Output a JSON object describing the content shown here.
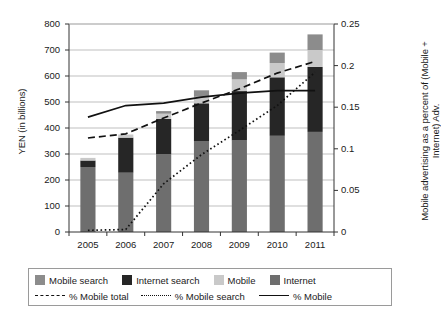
{
  "chart_data": {
    "type": "bar",
    "subtype": "stacked-bar-with-lines",
    "title": "",
    "xlabel": "",
    "ylabel": "YEN (in billions)",
    "ylabel_right": "Mobile advertising as a percent of (Mobile + Internet) Adv.",
    "categories": [
      "2005",
      "2006",
      "2007",
      "2008",
      "2009",
      "2010",
      "2011"
    ],
    "ylim": [
      0,
      800
    ],
    "yticks": [
      0,
      100,
      200,
      300,
      400,
      500,
      600,
      700,
      800
    ],
    "ytick_labels": [
      "0",
      "100",
      "200",
      "300",
      "400",
      "500",
      "600",
      "700",
      "800"
    ],
    "ylim_right": [
      0,
      0.25
    ],
    "yticks_right": [
      0,
      0.05,
      0.1,
      0.15,
      0.2,
      0.25
    ],
    "ytick_labels_right": [
      "0",
      "0.05",
      "0.1",
      "0.15",
      "0.2",
      "0.25"
    ],
    "grid": true,
    "grid_axis": "y",
    "legend_position": "bottom",
    "series": [
      {
        "name": "Internet",
        "kind": "bar-segment",
        "color": "#6e6e6e",
        "values": [
          250,
          228,
          300,
          350,
          352,
          370,
          385
        ]
      },
      {
        "name": "Internet search",
        "kind": "bar-segment",
        "color": "#262626",
        "values": [
          25,
          135,
          135,
          145,
          190,
          225,
          250
        ]
      },
      {
        "name": "Mobile",
        "kind": "bar-segment",
        "color": "#c9c9c9",
        "values": [
          10,
          12,
          20,
          25,
          45,
          55,
          65
        ]
      },
      {
        "name": "Mobile search",
        "kind": "bar-segment",
        "color": "#8c8c8c",
        "values": [
          0,
          0,
          10,
          25,
          28,
          40,
          60
        ]
      }
    ],
    "bar_totals": [
      285,
      375,
      465,
      545,
      615,
      690,
      760
    ],
    "lines": [
      {
        "name": "% Mobile total",
        "style": "dashed",
        "color": "#111111",
        "axis": "right",
        "values": [
          0.113,
          0.118,
          0.137,
          0.155,
          0.172,
          0.191,
          0.205
        ]
      },
      {
        "name": "% Mobile search",
        "style": "dotted",
        "color": "#111111",
        "axis": "right",
        "values": [
          0.002,
          0.003,
          0.058,
          0.093,
          0.122,
          0.152,
          0.192
        ]
      },
      {
        "name": "% Mobile",
        "style": "solid",
        "color": "#111111",
        "axis": "right",
        "values": [
          0.138,
          0.152,
          0.155,
          0.162,
          0.167,
          0.17,
          0.17
        ]
      }
    ],
    "legend": [
      {
        "label": "Mobile search",
        "type": "swatch",
        "color": "#8c8c8c"
      },
      {
        "label": "Internet search",
        "type": "swatch",
        "color": "#262626"
      },
      {
        "label": "Mobile",
        "type": "swatch",
        "color": "#c9c9c9"
      },
      {
        "label": "Internet",
        "type": "swatch",
        "color": "#6e6e6e"
      },
      {
        "label": "% Mobile total",
        "type": "line",
        "style": "dashed"
      },
      {
        "label": "% Mobile search",
        "type": "line",
        "style": "dotted"
      },
      {
        "label": "% Mobile",
        "type": "line",
        "style": "solid"
      }
    ]
  }
}
